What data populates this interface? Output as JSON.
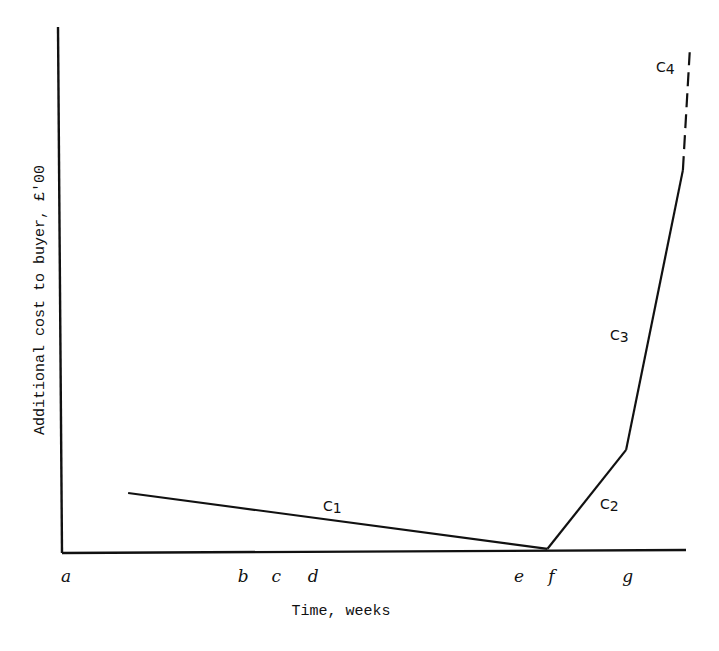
{
  "chart_data": {
    "type": "line",
    "title": "",
    "xlabel": "Time, weeks",
    "ylabel": "Additional cost to buyer, £'00",
    "x_tick_labels": [
      "a",
      "b",
      "c",
      "d",
      "e",
      "f",
      "g"
    ],
    "x_tick_positions": {
      "a": 0,
      "b": 0.284,
      "c": 0.337,
      "d": 0.396,
      "e": 0.726,
      "f": 0.778,
      "g": 0.9
    },
    "y_range": [
      0,
      1
    ],
    "x_range": [
      0,
      1
    ],
    "grid": false,
    "series": [
      {
        "name": "C1",
        "style": "solid",
        "points": [
          [
            0.106,
            0.114
          ],
          [
            0.778,
            0.008
          ]
        ]
      },
      {
        "name": "C2",
        "style": "solid",
        "points": [
          [
            0.778,
            0.008
          ],
          [
            0.904,
            0.196
          ]
        ]
      },
      {
        "name": "C3",
        "style": "solid",
        "points": [
          [
            0.904,
            0.196
          ],
          [
            0.995,
            0.728
          ]
        ]
      },
      {
        "name": "C4",
        "style": "dashed",
        "points": [
          [
            0.995,
            0.728
          ],
          [
            1.006,
            0.952
          ]
        ]
      }
    ],
    "curve_labels": [
      {
        "base": "C",
        "sub": "1"
      },
      {
        "base": "C",
        "sub": "2"
      },
      {
        "base": "C",
        "sub": "3"
      },
      {
        "base": "C",
        "sub": "4"
      }
    ]
  }
}
